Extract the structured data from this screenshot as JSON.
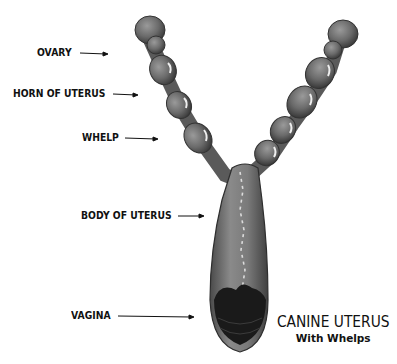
{
  "diagram": {
    "title": "CANINE UTERUS",
    "subtitle": "With Whelps",
    "labels": [
      {
        "id": "ovary",
        "text": "OVARY"
      },
      {
        "id": "horn",
        "text": "HORN OF UTERUS"
      },
      {
        "id": "whelp",
        "text": "WHELP"
      },
      {
        "id": "body",
        "text": "BODY OF UTERUS"
      },
      {
        "id": "vagina",
        "text": "VAGINA"
      }
    ],
    "colors": {
      "organ": "#6e6e6e",
      "organ_dark": "#3a3a3a",
      "highlight": "#e8e8e8",
      "text": "#111111"
    }
  }
}
